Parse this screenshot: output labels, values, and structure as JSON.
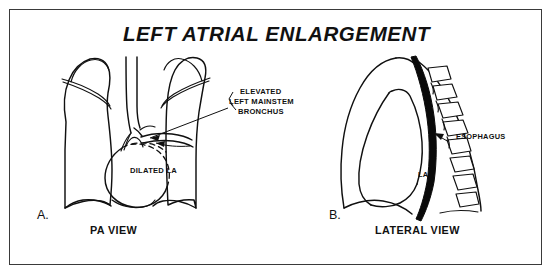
{
  "figure": {
    "title": "LEFT ATRIAL ENLARGEMENT",
    "frame_color": "#3a3a3a",
    "background_color": "#ffffff",
    "ink_color": "#101010"
  },
  "panel_a": {
    "letter": "A.",
    "caption": "PA VIEW",
    "annotations": {
      "bronchus_line1": "ELEVATED",
      "bronchus_line2": "LEFT MAINSTEM",
      "bronchus_line3": "BRONCHUS",
      "dilated_la": "DILATED LA"
    }
  },
  "panel_b": {
    "letter": "B.",
    "caption": "LATERAL VIEW",
    "annotations": {
      "la": "LA",
      "esophagus": "ESOPHAGUS"
    },
    "esophagus_color": "#0a0a0a",
    "vertebra_count": 9
  }
}
